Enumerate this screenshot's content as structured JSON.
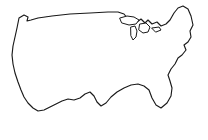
{
  "figure": {
    "title": "United States outline map",
    "background_color": "#ffffff",
    "outline_color": "#1a1a1a",
    "shading_color": "#111111",
    "width": 208,
    "height": 140
  },
  "regions": [
    {
      "id": "western-region",
      "label": "Western United States",
      "pattern": "diagonal-hatch",
      "pattern_direction": "up-right",
      "pattern_spacing_px": 3,
      "color": "#111111"
    },
    {
      "id": "northwest-region",
      "label": "Pacific Northwest and Northern Rockies",
      "pattern": "cross-hatch",
      "pattern_spacing_px": 2,
      "color": "#111111"
    }
  ],
  "features": [
    {
      "id": "national-border",
      "label": "National boundary outline"
    },
    {
      "id": "great-lakes",
      "label": "Great Lakes"
    },
    {
      "id": "florida-peninsula",
      "label": "Florida peninsula"
    },
    {
      "id": "gulf-coast",
      "label": "Gulf of Mexico coastline"
    },
    {
      "id": "pacific-coast",
      "label": "Pacific coastline"
    },
    {
      "id": "atlantic-coast",
      "label": "Atlantic coastline"
    },
    {
      "id": "northern-border",
      "label": "Canadian border"
    },
    {
      "id": "southern-border",
      "label": "Mexican border"
    }
  ]
}
